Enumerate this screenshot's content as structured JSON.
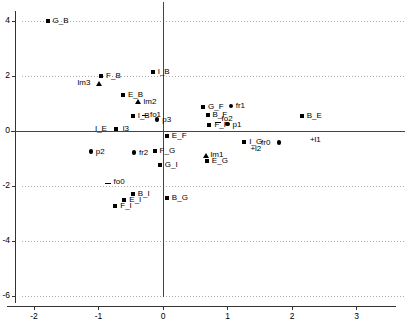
{
  "chart_data": {
    "type": "scatter",
    "title": "",
    "xlabel": "",
    "ylabel": "",
    "xlim": [
      -2.55,
      3.75
    ],
    "ylim": [
      -6.7,
      4.7
    ],
    "grid": true,
    "grid_style": "dotted",
    "legend_position": "none",
    "xticks": [
      "-2",
      "-1",
      "0",
      "1",
      "2",
      "3"
    ],
    "xtick_values": [
      -2,
      -1,
      0,
      1,
      2,
      3
    ],
    "yticks": [
      "4",
      "2",
      "0",
      "-2",
      "-4",
      "-6"
    ],
    "ytick_values": [
      4,
      2,
      0,
      -2,
      -4,
      -6
    ],
    "axis_lines": {
      "x_zero": 0,
      "y_zero": 0
    },
    "points": [
      {
        "label": "G_B",
        "x": -1.79,
        "y": 4.0,
        "marker": "square",
        "label_dx": 5,
        "label_dy": -4
      },
      {
        "label": "F_B",
        "x": -0.96,
        "y": 2.0,
        "marker": "square",
        "label_dx": 5,
        "label_dy": -4
      },
      {
        "label": "lm3",
        "x": -1.0,
        "y": 1.74,
        "marker": "triangle",
        "label_dx": -21,
        "label_dy": -4
      },
      {
        "label": "I_B",
        "x": -0.16,
        "y": 2.15,
        "marker": "square",
        "label_dx": 5,
        "label_dy": -4
      },
      {
        "label": "E_B",
        "x": -0.62,
        "y": 1.32,
        "marker": "square",
        "label_dx": 5,
        "label_dy": -4
      },
      {
        "label": "lm2",
        "x": -0.38,
        "y": 1.07,
        "marker": "triangle",
        "label_dx": 5,
        "label_dy": -4
      },
      {
        "label": "G_F",
        "x": 0.62,
        "y": 0.89,
        "marker": "square",
        "label_dx": 5,
        "label_dy": -4
      },
      {
        "label": "fr1",
        "x": 1.05,
        "y": 0.92,
        "marker": "circle",
        "label_dx": 5,
        "label_dy": -4
      },
      {
        "label": "B_F",
        "x": 0.69,
        "y": 0.59,
        "marker": "square",
        "label_dx": 5,
        "label_dy": -4
      },
      {
        "label": "I_B",
        "x": -0.47,
        "y": 0.55,
        "marker": "square",
        "label_dx": 5,
        "label_dy": -4
      },
      {
        "label": "fo1",
        "x": -0.28,
        "y": 0.57,
        "marker": "dash",
        "label_dx": 5,
        "label_dy": -4
      },
      {
        "label": "p3",
        "x": -0.09,
        "y": 0.42,
        "marker": "circle",
        "label_dx": 5,
        "label_dy": -3
      },
      {
        "label": "B_E",
        "x": 2.15,
        "y": 0.54,
        "marker": "square",
        "label_dx": 5,
        "label_dy": -4
      },
      {
        "label": "fo2",
        "x": 0.86,
        "y": 0.32,
        "marker": "dash",
        "label_dx": 3,
        "label_dy": -7
      },
      {
        "label": "p1",
        "x": 1.0,
        "y": 0.26,
        "marker": "circle",
        "label_dx": 5,
        "label_dy": -3
      },
      {
        "label": "F_F",
        "x": 0.72,
        "y": 0.21,
        "marker": "square",
        "label_dx": 5,
        "label_dy": -4
      },
      {
        "label": "I_E",
        "x": -0.73,
        "y": 0.06,
        "marker": "square",
        "label_dx": -21,
        "label_dy": -4
      },
      {
        "label": "l3",
        "x": -0.7,
        "y": 0.06,
        "marker": "none",
        "label_dx": 5,
        "label_dy": -4
      },
      {
        "label": "E_F",
        "x": 0.06,
        "y": -0.18,
        "marker": "square",
        "label_dx": 5,
        "label_dy": -4
      },
      {
        "label": "I_G",
        "x": 1.26,
        "y": -0.4,
        "marker": "square",
        "label_dx": 5,
        "label_dy": -4
      },
      {
        "label": "+l2",
        "x": 1.34,
        "y": -0.62,
        "marker": "none",
        "label_dx": 1,
        "label_dy": -3
      },
      {
        "label": "fr0",
        "x": 1.8,
        "y": -0.42,
        "marker": "circle",
        "label_dx": -18,
        "label_dy": -4
      },
      {
        "label": "+l1",
        "x": 2.2,
        "y": -0.34,
        "marker": "none",
        "label_dx": 0,
        "label_dy": -4
      },
      {
        "label": "p2",
        "x": -1.12,
        "y": -0.74,
        "marker": "circle",
        "label_dx": 5,
        "label_dy": -3
      },
      {
        "label": "fr2",
        "x": -0.45,
        "y": -0.78,
        "marker": "circle",
        "label_dx": 5,
        "label_dy": -3
      },
      {
        "label": "F_G",
        "x": -0.13,
        "y": -0.72,
        "marker": "square",
        "label_dx": 5,
        "label_dy": -4
      },
      {
        "label": "lm1",
        "x": 0.66,
        "y": -0.9,
        "marker": "triangle",
        "label_dx": 5,
        "label_dy": -5
      },
      {
        "label": "E_G",
        "x": 0.68,
        "y": -1.08,
        "marker": "square",
        "label_dx": 5,
        "label_dy": -4
      },
      {
        "label": "G_I",
        "x": -0.05,
        "y": -1.25,
        "marker": "square",
        "label_dx": 5,
        "label_dy": -4
      },
      {
        "label": "fo0",
        "x": -0.86,
        "y": -1.9,
        "marker": "dash",
        "label_dx": 6,
        "label_dy": -5
      },
      {
        "label": "B_I",
        "x": -0.47,
        "y": -2.3,
        "marker": "square",
        "label_dx": 5,
        "label_dy": -4
      },
      {
        "label": "E_I",
        "x": -0.6,
        "y": -2.52,
        "marker": "square",
        "label_dx": 5,
        "label_dy": -4
      },
      {
        "label": "F_I",
        "x": -0.74,
        "y": -2.72,
        "marker": "square",
        "label_dx": 5,
        "label_dy": -4
      },
      {
        "label": "B_G",
        "x": 0.06,
        "y": -2.45,
        "marker": "square",
        "label_dx": 5,
        "label_dy": -4
      }
    ]
  },
  "colors": {
    "marker": "#000000",
    "axis": "#555555",
    "grid": "#999999",
    "text": "#000000",
    "background": "#ffffff"
  }
}
